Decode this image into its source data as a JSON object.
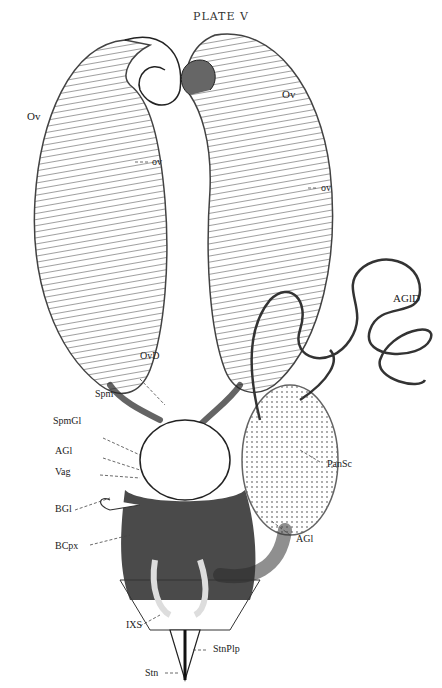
{
  "plate": {
    "title": "PLATE V"
  },
  "labels": {
    "ov_left": "Ov",
    "ov_left_small": "ov",
    "ov_right": "Ov",
    "ov_right_small": "ov",
    "agld": "AGlD",
    "ovd": "OvD",
    "spm": "Spm",
    "spmgl": "SpmGl",
    "agl_left": "AGl",
    "vag": "Vag",
    "bgl": "BGl",
    "bcpx": "BCpx",
    "pansc": "PanSc",
    "agl_right": "AGl",
    "ixs": "IXS",
    "stnplp": "StnPlp",
    "stn": "Stn"
  },
  "colors": {
    "ink": "#222222",
    "paper": "#ffffff",
    "shade": "#3a3a3a"
  }
}
